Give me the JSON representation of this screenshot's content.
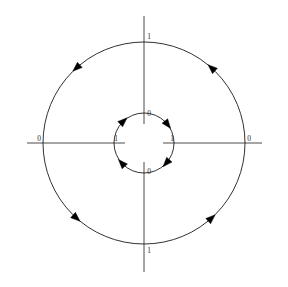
{
  "figure": {
    "background_color": "#ffffff",
    "axis_color": "#4c4c4c",
    "curve_color": "#1a1a1a",
    "arrow_color": "#000000",
    "label_color": "#2b2b2b",
    "center": {
      "x": 144,
      "y": 143
    }
  },
  "axes": {
    "horizontal": {
      "name": "horizontal-axis",
      "y": 143,
      "segments": [
        {
          "x1": 27,
          "x2": 125
        },
        {
          "x1": 163,
          "x2": 262
        }
      ]
    },
    "vertical": {
      "name": "vertical-axis",
      "x": 144,
      "segments": [
        {
          "y1": 16,
          "y2": 124
        },
        {
          "y1": 162,
          "y2": 272
        }
      ]
    }
  },
  "labels": [
    {
      "id": "outer-top",
      "text": "1",
      "x": 149,
      "y": 37
    },
    {
      "id": "outer-left",
      "text": "0",
      "x": 39,
      "y": 139
    },
    {
      "id": "outer-right",
      "text": "0",
      "x": 249,
      "y": 139
    },
    {
      "id": "outer-bottom",
      "text": "1",
      "x": 149,
      "y": 251
    },
    {
      "id": "inner-top",
      "text": "0",
      "x": 149,
      "y": 114
    },
    {
      "id": "inner-left",
      "text": "1",
      "x": 116,
      "y": 139
    },
    {
      "id": "inner-right",
      "text": "1",
      "x": 172,
      "y": 139
    },
    {
      "id": "inner-bottom",
      "text": "0",
      "x": 149,
      "y": 172
    }
  ],
  "circles": [
    {
      "id": "outer-circle",
      "name": "outer-orbit",
      "radius": 101,
      "direction": "counterclockwise",
      "stroke_color": "#1a1a1a",
      "arrows": [
        {
          "id": "outer-arrow-upper-left",
          "angle_deg": 132,
          "heading": "counterclockwise"
        },
        {
          "id": "outer-arrow-upper-right",
          "angle_deg": 48,
          "heading": "counterclockwise"
        },
        {
          "id": "outer-arrow-lower-left",
          "angle_deg": 228,
          "heading": "counterclockwise"
        },
        {
          "id": "outer-arrow-lower-right",
          "angle_deg": 312,
          "heading": "counterclockwise"
        }
      ]
    },
    {
      "id": "inner-circle",
      "name": "inner-orbit",
      "radius": 30,
      "direction": "clockwise",
      "stroke_color": "#1a1a1a",
      "arrows": [
        {
          "id": "inner-arrow-upper-left",
          "angle_deg": 133,
          "heading": "clockwise"
        },
        {
          "id": "inner-arrow-upper-right",
          "angle_deg": 38,
          "heading": "clockwise"
        },
        {
          "id": "inner-arrow-lower-right",
          "angle_deg": 318,
          "heading": "clockwise"
        },
        {
          "id": "inner-arrow-lower-left",
          "angle_deg": 222,
          "heading": "clockwise"
        }
      ]
    }
  ]
}
